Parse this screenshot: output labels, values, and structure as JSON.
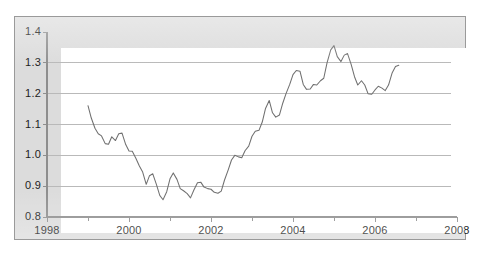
{
  "chart_data": {
    "type": "line",
    "title": "",
    "subtitle": "",
    "xlabel": "",
    "ylabel": "",
    "xlim": [
      1998,
      2008
    ],
    "ylim": [
      0.8,
      1.4
    ],
    "grid": true,
    "legend": null,
    "legend_position": "none",
    "x_ticks_major": [
      1998,
      2000,
      2002,
      2004,
      2006,
      2008
    ],
    "x_ticks_minor": [
      1999,
      2001,
      2003,
      2005,
      2007
    ],
    "x_tick_labels": [
      "1998",
      "2000",
      "2002",
      "2004",
      "2006",
      "2008"
    ],
    "y_ticks": [
      0.8,
      0.9,
      1.0,
      1.1,
      1.2,
      1.3,
      1.4
    ],
    "y_tick_labels": [
      "0.8",
      "0.9",
      "1.0",
      "1.1",
      "1.2",
      "1.3",
      "1.4"
    ],
    "series": [
      {
        "name": "series-1",
        "color": "#6f6f6f",
        "x": [
          1999.0,
          1999.08,
          1999.17,
          1999.25,
          1999.33,
          1999.42,
          1999.5,
          1999.58,
          1999.67,
          1999.75,
          1999.83,
          1999.92,
          2000.0,
          2000.08,
          2000.17,
          2000.25,
          2000.33,
          2000.42,
          2000.5,
          2000.58,
          2000.67,
          2000.75,
          2000.83,
          2000.92,
          2001.0,
          2001.08,
          2001.17,
          2001.25,
          2001.33,
          2001.42,
          2001.5,
          2001.58,
          2001.67,
          2001.75,
          2001.83,
          2001.92,
          2002.0,
          2002.08,
          2002.17,
          2002.25,
          2002.33,
          2002.42,
          2002.5,
          2002.58,
          2002.67,
          2002.75,
          2002.83,
          2002.92,
          2003.0,
          2003.08,
          2003.17,
          2003.25,
          2003.33,
          2003.42,
          2003.5,
          2003.58,
          2003.67,
          2003.75,
          2003.83,
          2003.92,
          2004.0,
          2004.08,
          2004.17,
          2004.25,
          2004.33,
          2004.42,
          2004.5,
          2004.58,
          2004.67,
          2004.75,
          2004.83,
          2004.92,
          2005.0,
          2005.08,
          2005.17,
          2005.25,
          2005.33,
          2005.42,
          2005.5,
          2005.58,
          2005.67,
          2005.75,
          2005.83,
          2005.92,
          2006.0,
          2006.08,
          2006.17,
          2006.25,
          2006.33,
          2006.42,
          2006.5,
          2006.58
        ],
        "y": [
          1.161,
          1.121,
          1.088,
          1.07,
          1.063,
          1.038,
          1.036,
          1.06,
          1.048,
          1.07,
          1.072,
          1.035,
          1.014,
          1.013,
          0.99,
          0.966,
          0.947,
          0.906,
          0.934,
          0.94,
          0.905,
          0.87,
          0.856,
          0.882,
          0.924,
          0.943,
          0.922,
          0.892,
          0.885,
          0.876,
          0.862,
          0.887,
          0.911,
          0.913,
          0.897,
          0.892,
          0.89,
          0.88,
          0.877,
          0.884,
          0.92,
          0.953,
          0.985,
          1.0,
          0.995,
          0.992,
          1.015,
          1.03,
          1.062,
          1.078,
          1.081,
          1.108,
          1.152,
          1.178,
          1.138,
          1.124,
          1.131,
          1.169,
          1.2,
          1.23,
          1.262,
          1.275,
          1.273,
          1.23,
          1.214,
          1.215,
          1.23,
          1.228,
          1.242,
          1.25,
          1.3,
          1.342,
          1.356,
          1.32,
          1.304,
          1.325,
          1.33,
          1.294,
          1.255,
          1.228,
          1.242,
          1.228,
          1.2,
          1.198,
          1.212,
          1.224,
          1.218,
          1.21,
          1.228,
          1.268,
          1.288,
          1.292
        ]
      }
    ]
  },
  "axes": {
    "y_axis_name": "value-axis",
    "x_axis_name": "year-axis"
  }
}
